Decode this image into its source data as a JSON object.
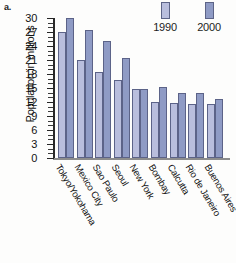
{
  "part_label": "a.",
  "legend": {
    "position": "top-right",
    "items": [
      {
        "label": "1990",
        "color": "#b9bedd"
      },
      {
        "label": "2000",
        "color": "#8f9bc5"
      }
    ]
  },
  "chart_data": {
    "type": "bar",
    "title": "",
    "subtitle": "",
    "xlabel": "",
    "ylabel": "Population in millions",
    "ylim": [
      0,
      30
    ],
    "yticks": [
      0,
      3,
      6,
      9,
      12,
      15,
      18,
      21,
      24,
      27,
      30
    ],
    "ytick_labels": [
      "0",
      "3",
      "6",
      "9",
      "12",
      "15",
      "18",
      "21",
      "24",
      "27",
      "30"
    ],
    "grid": false,
    "minor_ticks": true,
    "legend_position": "top-right",
    "categories": [
      "Tokyo/Yokohama",
      "Mexico City",
      "Sao Paulo",
      "Seoul",
      "New York",
      "Bombay",
      "Calcutta",
      "Rio de Janeiro",
      "Buenos Aires"
    ],
    "series": [
      {
        "name": "1990",
        "color": "#b9bedd",
        "values": [
          27,
          21,
          18.5,
          16.8,
          14.7,
          12.1,
          11.8,
          11.6,
          11.5
        ]
      },
      {
        "name": "2000",
        "color": "#8f9bc5",
        "values": [
          30,
          27.5,
          25,
          21.5,
          14.8,
          15.3,
          13.9,
          13.9,
          12.6
        ]
      }
    ]
  }
}
